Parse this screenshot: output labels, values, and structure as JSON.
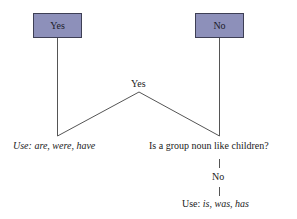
{
  "diagram": {
    "type": "decision-flowchart",
    "boxes": [
      {
        "id": "yes-box",
        "label": "Yes"
      },
      {
        "id": "no-box",
        "label": "No"
      }
    ],
    "junction_label": "Yes",
    "left_result": {
      "prefix": "Use: ",
      "words": "are, were, have"
    },
    "right_question": "Is a group noun like children?",
    "right_branch_label": "No",
    "right_result": {
      "prefix": "Use: ",
      "words": "is, was, has"
    },
    "colors": {
      "box_fill": "#8d90ba",
      "box_border": "#3e3f55",
      "line": "#555555"
    }
  }
}
